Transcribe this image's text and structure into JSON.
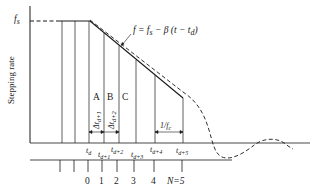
{
  "diagram": {
    "type": "stepping-motor-deceleration-timing",
    "y_axis_label": "Stepping rate",
    "fs_label": "f",
    "fs_sub": "s",
    "equation": {
      "text": "f = f",
      "sub_s": "s",
      "rest": " − β (t − t",
      "sub_d": "d",
      "close": ")"
    },
    "region_labels": [
      "A",
      "B",
      "C"
    ],
    "delta_labels": [
      {
        "main": "Δt",
        "sub": "d+1"
      },
      {
        "main": "Δt",
        "sub": "d+2"
      }
    ],
    "period_label": {
      "main": "1/f",
      "sub": "c"
    },
    "time_labels": [
      {
        "main": "t",
        "sub": "d"
      },
      {
        "main": "t",
        "sub": "d+1"
      },
      {
        "main": "t",
        "sub": "d+2"
      },
      {
        "main": "t",
        "sub": "d+3"
      },
      {
        "main": "t",
        "sub": "d+4"
      },
      {
        "main": "t",
        "sub": "d+5"
      }
    ],
    "step_numbers": [
      "0",
      "1",
      "2",
      "3",
      "4",
      "N=5"
    ],
    "colors": {
      "line": "#1a1a1a",
      "background": "#ffffff"
    }
  }
}
